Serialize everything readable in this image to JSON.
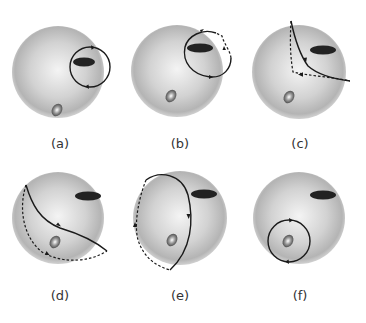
{
  "figure": {
    "panels": [
      {
        "id": "a",
        "label": "(a)",
        "description": "closed solid loop encircling the dark ellipse (upper right)"
      },
      {
        "id": "b",
        "label": "(b)",
        "description": "loop around dark ellipse with dashed segment crossing sphere edge"
      },
      {
        "id": "c",
        "label": "(c)",
        "description": "solid and dashed paths forming a cusp near the upper-left edge, passing left of the dark ellipse"
      },
      {
        "id": "d",
        "label": "(d)",
        "description": "solid path from upper-left edge to right edge, dashed return behind sphere, enclosing the small shiny ellipse"
      },
      {
        "id": "e",
        "label": "(e)",
        "description": "large loop, solid on front, dashed on the left edge, enclosing the small shiny ellipse"
      },
      {
        "id": "f",
        "label": "(f)",
        "description": "closed solid loop encircling the small shiny ellipse (lower left)"
      }
    ],
    "colors": {
      "sphere_light": "#f2f2f2",
      "sphere_dark": "#a8a8a8",
      "dark_ellipse": "#222222",
      "path": "#1a1a1a"
    }
  }
}
